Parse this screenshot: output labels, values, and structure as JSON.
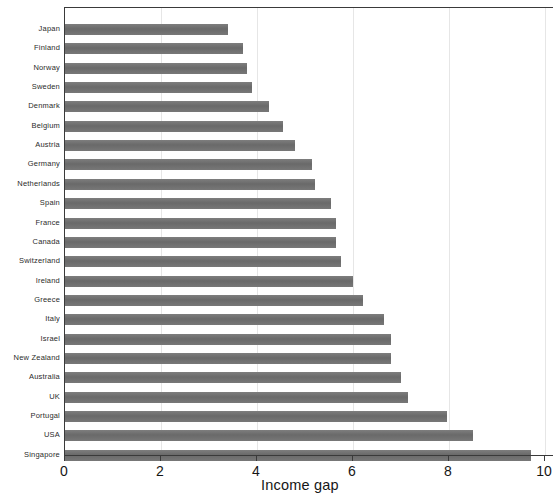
{
  "chart_data": {
    "type": "bar",
    "orientation": "horizontal",
    "title": "",
    "subtitle": "",
    "xlabel": "Income gap",
    "ylabel": "",
    "xlim": [
      0,
      10
    ],
    "ylim": null,
    "xticks": [
      0,
      2,
      4,
      6,
      8,
      10
    ],
    "xticklabels": [
      "0",
      "2",
      "4",
      "6",
      "8",
      "10"
    ],
    "grid": "faint vertical gridlines at x ticks",
    "legend": null,
    "legend_position": "none",
    "bar_color": "#6f6f6f",
    "axis_color": "#3a3a3a",
    "background_color": "#ffffff",
    "categories": [
      "Japan",
      "Finland",
      "Norway",
      "Sweden",
      "Denmark",
      "Belgium",
      "Austria",
      "Germany",
      "Netherlands",
      "Spain",
      "France",
      "Canada",
      "Switzerland",
      "Ireland",
      "Greece",
      "Italy",
      "Israel",
      "New Zealand",
      "Australia",
      "UK",
      "Portugal",
      "USA",
      "Singapore"
    ],
    "values": [
      3.4,
      3.7,
      3.8,
      3.9,
      4.25,
      4.55,
      4.8,
      5.15,
      5.2,
      5.55,
      5.65,
      5.65,
      5.75,
      6.0,
      6.2,
      6.65,
      6.8,
      6.8,
      7.0,
      7.15,
      7.95,
      8.5,
      9.7
    ]
  },
  "axis": {
    "x_title": "Income gap"
  }
}
